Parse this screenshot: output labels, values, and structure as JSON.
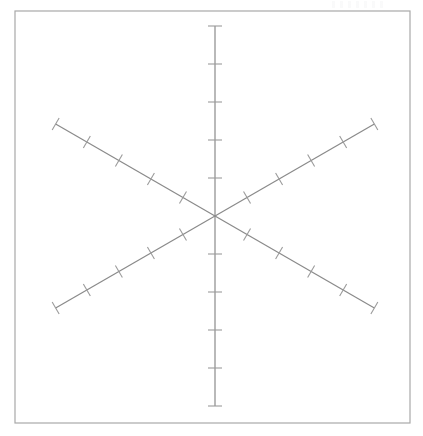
{
  "figure": {
    "title": "",
    "background_color": "#ffffff",
    "width": 423,
    "height": 436,
    "frame": {
      "name": "plot-frame",
      "x": 15,
      "y": 11,
      "width": 395,
      "height": 412,
      "stroke_color": "#a8a8a8",
      "stroke_width": 1.2
    },
    "artifact": {
      "name": "faint-watermark-smudge",
      "description": "illegible faint marks at top right",
      "visible": true
    }
  },
  "chart_data": {
    "type": "line",
    "title": "",
    "subtitle": "",
    "xlabel": "",
    "ylabel": "",
    "legend_position": "none",
    "grid": false,
    "center": {
      "x": 215,
      "y": 216
    },
    "axis_count": 3,
    "ticks_per_half_ray": 5,
    "tick_spacing_px": 38,
    "tick_length_px": 14,
    "line_color": "#8a8a8a",
    "line_width": 1.2,
    "tick_color": "#9b9b9b",
    "tick_width": 1.1,
    "axes": [
      {
        "name": "vertical-axis",
        "angle_deg": 90,
        "start": {
          "x": 215,
          "y": 26
        },
        "end": {
          "x": 215,
          "y": 406
        },
        "half_length_px": 190,
        "tick_orientation_deg": 0,
        "tick_positions_px": [
          38,
          76,
          114,
          152,
          190
        ]
      },
      {
        "name": "ascending-diagonal-axis",
        "angle_deg": 30,
        "start": {
          "x": 56,
          "y": 308
        },
        "end": {
          "x": 374,
          "y": 124
        },
        "half_length_px": 184,
        "tick_orientation_deg": 120,
        "tick_positions_px": [
          37,
          74,
          111,
          148,
          184
        ]
      },
      {
        "name": "descending-diagonal-axis",
        "angle_deg": -30,
        "start": {
          "x": 56,
          "y": 124
        },
        "end": {
          "x": 374,
          "y": 308
        },
        "half_length_px": 184,
        "tick_orientation_deg": 60,
        "tick_positions_px": [
          37,
          74,
          111,
          148,
          184
        ]
      }
    ]
  }
}
